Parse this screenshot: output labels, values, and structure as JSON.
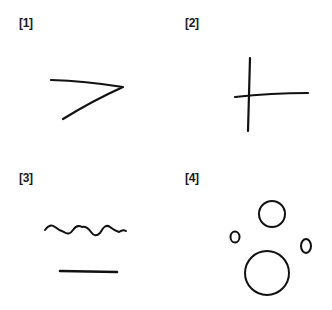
{
  "figure": {
    "panels": [
      {
        "label": "[1]",
        "content": "angled stroke resembling a 7 / greater-than shape"
      },
      {
        "label": "[2]",
        "content": "cross / plus shape with long right arm"
      },
      {
        "label": "[3]",
        "content": "wavy line above a straight horizontal line"
      },
      {
        "label": "[4]",
        "content": "four hand-drawn circles of varying sizes"
      }
    ],
    "stroke_color": "#111111",
    "background": "#ffffff"
  }
}
